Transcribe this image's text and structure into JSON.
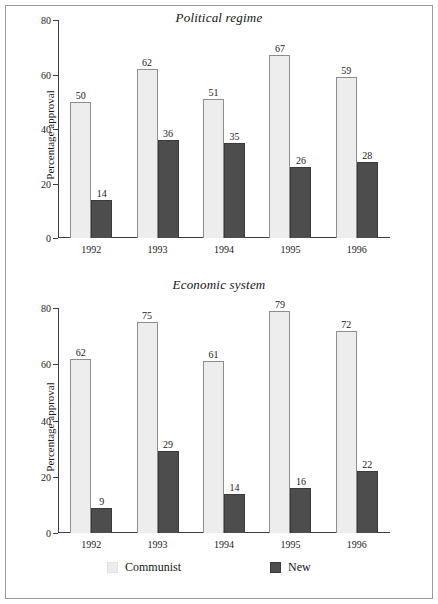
{
  "figure": {
    "background": "#ffffff",
    "frame_color": "#9a9a9a"
  },
  "legend": {
    "items": [
      {
        "label": "Communist",
        "color": "#ececec",
        "icon": "legend-swatch"
      },
      {
        "label": "New",
        "color": "#4d4d4d",
        "icon": "legend-swatch"
      }
    ]
  },
  "chart_data": [
    {
      "type": "bar",
      "title": "Political regime",
      "xlabel": "",
      "ylabel": "Percentage approval",
      "categories": [
        "1992",
        "1993",
        "1994",
        "1995",
        "1996"
      ],
      "series": [
        {
          "name": "Communist",
          "color": "#ededed",
          "values": [
            50,
            62,
            51,
            67,
            59
          ]
        },
        {
          "name": "New",
          "color": "#4d4d4d",
          "values": [
            14,
            36,
            35,
            26,
            28
          ]
        }
      ],
      "ylim": [
        0,
        80
      ],
      "yticks": [
        0,
        20,
        40,
        60,
        80
      ],
      "ytick_labels": [
        "0",
        "20",
        "40",
        "60",
        "80"
      ],
      "grid": false,
      "legend_position": "bottom",
      "data_labels": true
    },
    {
      "type": "bar",
      "title": "Economic system",
      "xlabel": "",
      "ylabel": "Percentage approval",
      "categories": [
        "1992",
        "1993",
        "1994",
        "1995",
        "1996"
      ],
      "series": [
        {
          "name": "Communist",
          "color": "#ededed",
          "values": [
            62,
            75,
            61,
            79,
            72
          ]
        },
        {
          "name": "New",
          "color": "#4d4d4d",
          "values": [
            9,
            29,
            14,
            16,
            22
          ]
        }
      ],
      "ylim": [
        0,
        80
      ],
      "yticks": [
        0,
        20,
        40,
        60,
        80
      ],
      "ytick_labels": [
        "0",
        "20",
        "40",
        "60",
        "80"
      ],
      "grid": false,
      "legend_position": "bottom",
      "data_labels": true
    }
  ]
}
